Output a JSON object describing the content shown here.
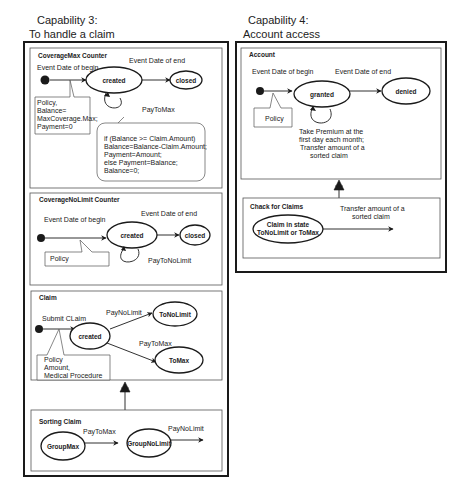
{
  "capability3": {
    "title_line1": "Capability 3:",
    "title_line2": "To handle a claim",
    "coverage_max_counter": {
      "title": "CoverageMax Counter",
      "event_begin": "Event Date of begin",
      "event_end": "Event Date of end",
      "states": [
        "created",
        "closed"
      ],
      "self_transition": "PayToMax",
      "note_initial": [
        "Policy,",
        "Balance=",
        "MaxCoverage.Max;",
        "Payment=0"
      ],
      "note_transition": [
        "if (Balance >= Claim.Amount)",
        " Balance=Balance-Claim.Amount;",
        "Payment=Amount;",
        " else  Payment=Balance;",
        "Balance=0;"
      ]
    },
    "coverage_nolimit_counter": {
      "title": "CoverageNoLimit Counter",
      "event_begin": "Event Date of begin",
      "event_end": "Event Date of end",
      "states": [
        "created",
        "closed"
      ],
      "self_transition": "PayToNoLimit",
      "note_initial": "Policy"
    },
    "claim": {
      "title": "Claim",
      "event_submit": "Submit CLaim",
      "states": [
        "created",
        "ToNoLimit",
        "ToMax"
      ],
      "transition_nolimit": "PayNoLimit",
      "transition_max": "PayToMax",
      "note_initial": [
        "Policy",
        "Amount,",
        "Medical  Procedure"
      ]
    },
    "sorting_claim": {
      "title": "Sorting Claim",
      "states": [
        "GroupMax",
        "GroupNoLimit"
      ],
      "transition_max": "PayToMax",
      "transition_nolimit": "PayNoLimit"
    }
  },
  "capability4": {
    "title_line1": "Capability 4:",
    "title_line2": "Account access",
    "account": {
      "title": "Account",
      "event_begin": "Event Date of begin",
      "event_end": "Event Date of end",
      "states": [
        "granted",
        "denied"
      ],
      "note_initial": "Policy",
      "self_transition": [
        "Take Premium at  the",
        "first day each month;",
        "Transfer amount of a",
        "sorted claim"
      ]
    },
    "check_for_claims": {
      "title": "Chack for Claims",
      "state": [
        "Claim in state",
        "ToNoLimit or ToMax"
      ],
      "transition": [
        "Transfer amount of a",
        "sorted claim"
      ]
    }
  },
  "colors": {
    "stroke": "#1a1a1a",
    "background": "#ffffff",
    "pane_border": "#555555"
  }
}
